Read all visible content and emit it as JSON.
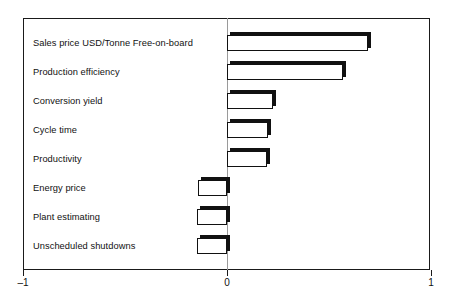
{
  "chart_data": {
    "type": "bar",
    "orientation": "horizontal",
    "title": "",
    "subtitle": "",
    "xlabel": "",
    "ylabel": "",
    "xlim": [
      -1,
      1
    ],
    "xticks": [
      -1,
      0,
      1
    ],
    "xticklabels": [
      "–1",
      "0",
      "1"
    ],
    "grid": false,
    "legend": null,
    "zero_reference_line": 0,
    "categories": [
      "Sales price USD/Tonne Free-on-board",
      "Production efficiency",
      "Conversion yield",
      "Cycle time",
      "Productivity",
      "Energy price",
      "Plant estimating",
      "Unscheduled shutdowns"
    ],
    "values": [
      0.69,
      0.57,
      0.225,
      0.2,
      0.195,
      -0.14,
      -0.145,
      -0.145
    ],
    "bars": [
      {
        "label": "Sales price USD/Tonne Free-on-board",
        "value": 0.69
      },
      {
        "label": "Production efficiency",
        "value": 0.57
      },
      {
        "label": "Conversion yield",
        "value": 0.225
      },
      {
        "label": "Cycle time",
        "value": 0.2
      },
      {
        "label": "Productivity",
        "value": 0.195
      },
      {
        "label": "Energy price",
        "value": -0.14
      },
      {
        "label": "Plant estimating",
        "value": -0.145
      },
      {
        "label": "Unscheduled shutdowns",
        "value": -0.145
      }
    ],
    "colors": {
      "bar_fill": "#ffffff",
      "bar_outline": "#111111",
      "bar_shadow": "#111111",
      "frame": "#1a1a1a",
      "zero_line": "#9a9a9a",
      "text": "#111111",
      "background": "#ffffff"
    }
  }
}
